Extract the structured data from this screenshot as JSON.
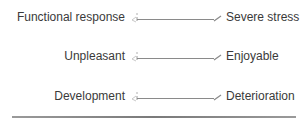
{
  "scales": [
    {
      "left": "Functional response",
      "right": "Severe stress"
    },
    {
      "left": "Unpleasant",
      "right": "Enjoyable"
    },
    {
      "left": "Development",
      "right": "Deterioration"
    }
  ],
  "colors": {
    "text": "#3a3a3a",
    "line": "#8a8a8a"
  }
}
